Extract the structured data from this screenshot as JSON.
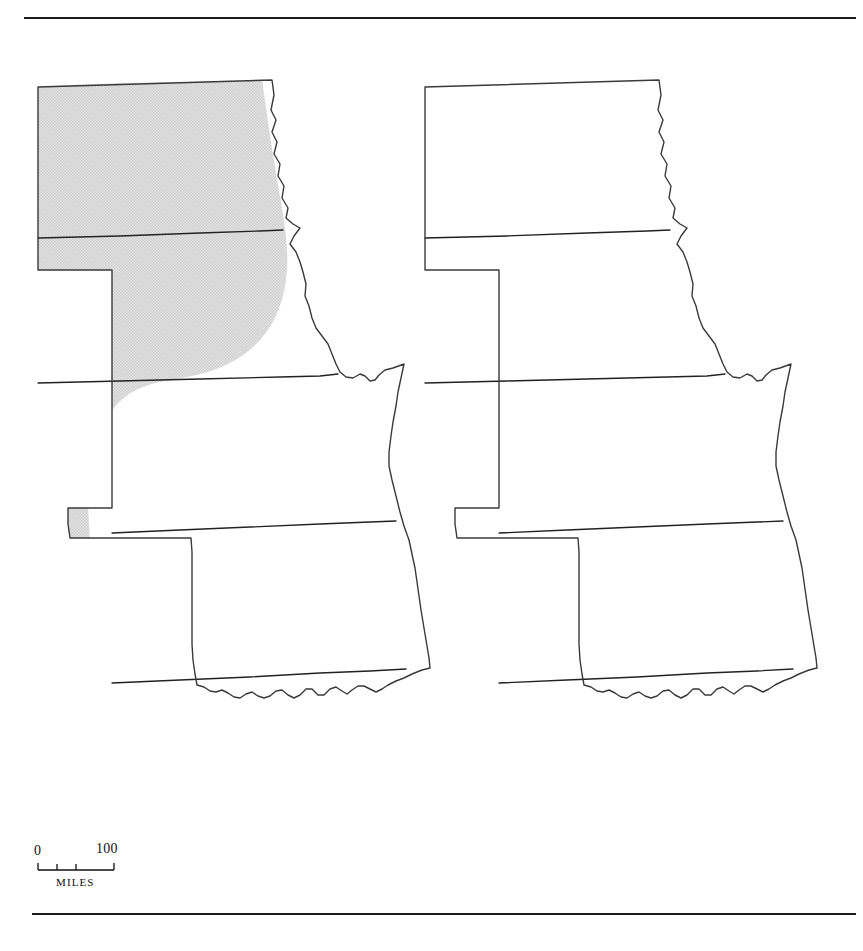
{
  "figure": {
    "domain": "map",
    "background_color": "#ffffff",
    "rules": {
      "top_rule": "horizontal-rule",
      "bottom_rule": "horizontal-rule",
      "rule_color": "#1a1a1a"
    }
  },
  "style": {
    "outline_color": "#3a3a3a",
    "state_border_color": "#222222",
    "shade_fill": "#dcdcdc",
    "shade_dot_color": "#bdbdbd",
    "map_fill": "#ffffff"
  },
  "maps": [
    {
      "id": "map-left",
      "position": "left",
      "shaded_region_note": "Shading covers the western and central portions of North Dakota, South Dakota, and the western edge of Nebraska; absent from eastern North Dakota, eastern South Dakota, most of Nebraska, Kansas and Oklahoma",
      "states": [
        {
          "name": "North Dakota",
          "shaded": "partial"
        },
        {
          "name": "South Dakota",
          "shaded": "partial"
        },
        {
          "name": "Nebraska",
          "shaded": "partial"
        },
        {
          "name": "Kansas",
          "shaded": "none"
        },
        {
          "name": "Oklahoma",
          "shaded": "none"
        }
      ]
    },
    {
      "id": "map-right",
      "position": "right",
      "shaded_region_note": "Shading covers eastern North Dakota, eastern and central South Dakota, most of Nebraska, western Kansas, and the Oklahoma panhandle and western Oklahoma",
      "states": [
        {
          "name": "North Dakota",
          "shaded": "partial"
        },
        {
          "name": "South Dakota",
          "shaded": "partial"
        },
        {
          "name": "Nebraska",
          "shaded": "most"
        },
        {
          "name": "Kansas",
          "shaded": "partial"
        },
        {
          "name": "Oklahoma",
          "shaded": "partial"
        }
      ]
    }
  ],
  "scale_bar": {
    "min_label": "0",
    "max_label": "100",
    "units_label": "MILES",
    "tick_count": 4
  }
}
